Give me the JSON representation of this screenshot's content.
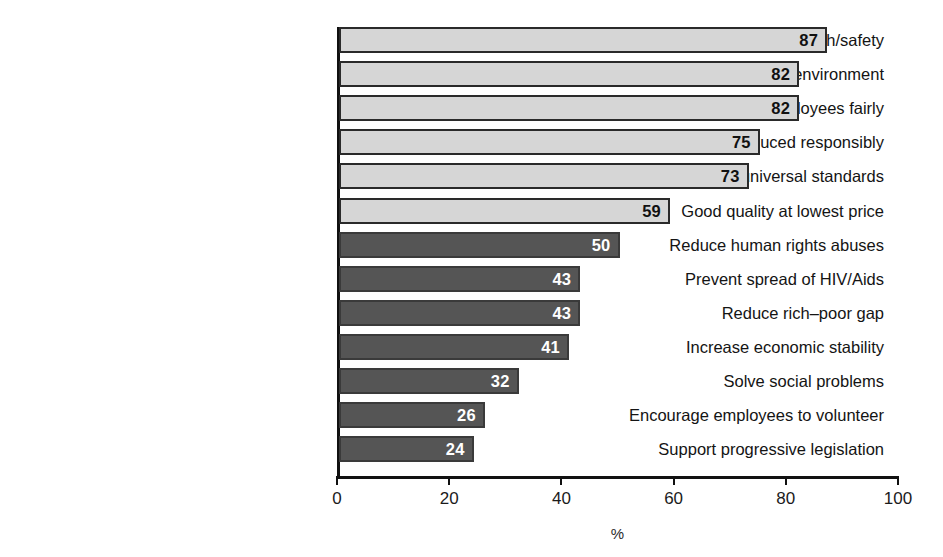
{
  "chart_data": {
    "type": "bar",
    "orientation": "horizontal",
    "title": "",
    "subtitle": "",
    "xlabel": "%",
    "ylabel": "",
    "xlim": [
      0,
      100
    ],
    "xticks": [
      0,
      20,
      40,
      60,
      80,
      100
    ],
    "xtick_labels": [
      "0",
      "20",
      "40",
      "60",
      "80",
      "100"
    ],
    "grid": false,
    "legend": "none",
    "value_labels_shown": true,
    "categories": [
      "Product health/safety",
      "Do not harm the environment",
      "Treat employees fairly",
      "Materials produced responsibly",
      "High universal standards",
      "Good quality at lowest price",
      "Reduce human rights abuses",
      "Prevent spread of HIV/Aids",
      "Reduce rich–poor gap",
      "Increase economic stability",
      "Solve social problems",
      "Encourage employees to volunteer",
      "Support progressive legislation"
    ],
    "values": [
      87,
      82,
      82,
      75,
      73,
      59,
      50,
      43,
      43,
      41,
      32,
      26,
      24
    ],
    "bar_groups": [
      "light",
      "light",
      "light",
      "light",
      "light",
      "light",
      "dark",
      "dark",
      "dark",
      "dark",
      "dark",
      "dark",
      "dark"
    ],
    "colors": {
      "light_bar_fill": "#d6d6d6",
      "light_bar_border": "#2a2a2a",
      "light_bar_label": "#111111",
      "dark_bar_fill": "#555555",
      "dark_bar_border": "#3a3a3a",
      "dark_bar_label": "#ffffff",
      "axis": "#111111",
      "text": "#141414",
      "background": "#ffffff"
    }
  }
}
